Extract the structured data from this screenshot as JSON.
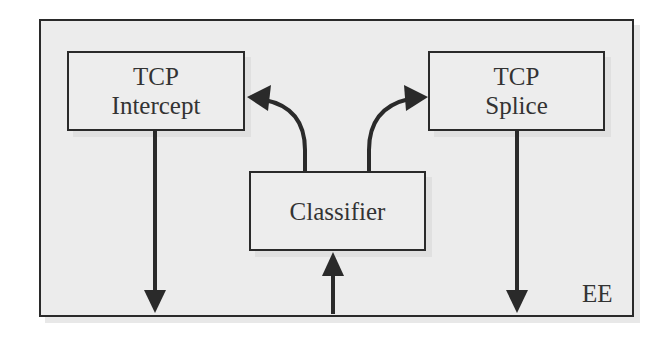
{
  "diagram": {
    "container": {
      "label": "EE"
    },
    "nodes": {
      "tcp_intercept": {
        "line1": "TCP",
        "line2": "Intercept"
      },
      "tcp_splice": {
        "line1": "TCP",
        "line2": "Splice"
      },
      "classifier": {
        "label": "Classifier"
      }
    },
    "edges": [
      {
        "from": "external-input",
        "to": "Classifier",
        "style": "straight",
        "direction": "up"
      },
      {
        "from": "Classifier",
        "to": "TCP Intercept",
        "style": "curved",
        "direction": "up-left"
      },
      {
        "from": "Classifier",
        "to": "TCP Splice",
        "style": "curved",
        "direction": "up-right"
      },
      {
        "from": "TCP Intercept",
        "to": "external-output",
        "style": "straight",
        "direction": "down"
      },
      {
        "from": "TCP Splice",
        "to": "external-output",
        "style": "straight",
        "direction": "down"
      }
    ],
    "colors": {
      "stroke": "#2a2a2a",
      "fill": "#ececec",
      "text": "#333333"
    }
  }
}
